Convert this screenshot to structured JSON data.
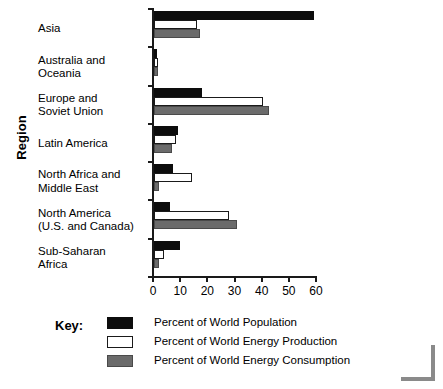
{
  "chart_data": {
    "type": "bar",
    "orientation": "horizontal",
    "title": "",
    "xlabel": "",
    "ylabel": "Region",
    "xlim": [
      0,
      60
    ],
    "xticks": [
      0,
      10,
      20,
      30,
      40,
      50,
      60
    ],
    "grid": false,
    "legend_position": "bottom-left",
    "legend_title": "Key:",
    "categories": [
      "Asia",
      "Australia and Oceania",
      "Europe and Soviet Union",
      "Latin America",
      "North Africa and Middle East",
      "North America (U.S. and Canada)",
      "Sub-Saharan Africa"
    ],
    "category_lines": [
      [
        "Asia"
      ],
      [
        "Australia and",
        "Oceania"
      ],
      [
        "Europe and",
        "Soviet Union"
      ],
      [
        "Latin America"
      ],
      [
        "North Africa and",
        "Middle East"
      ],
      [
        "North America",
        "(U.S. and Canada)"
      ],
      [
        "Sub-Saharan",
        "Africa"
      ]
    ],
    "series": [
      {
        "name": "Percent of World Population",
        "key": "pop",
        "color": "#0d0d0d",
        "values": [
          59,
          1,
          17.5,
          9,
          7,
          6,
          9.5
        ]
      },
      {
        "name": "Percent of World Energy Production",
        "key": "prod",
        "color": "#ffffff",
        "values": [
          16,
          1.5,
          40,
          8,
          14,
          27.5,
          3.5
        ]
      },
      {
        "name": "Percent of World Energy Consumption",
        "key": "cons",
        "color": "#6b6b6b",
        "values": [
          17,
          1.5,
          42.5,
          6.5,
          2,
          30.5,
          2
        ]
      }
    ]
  },
  "colors": {
    "population": "#0d0d0d",
    "production": "#ffffff",
    "consumption": "#6b6b6b",
    "axis": "#1a1a1a",
    "background": "#ffffff",
    "corner_mark": "#8a8a8a"
  }
}
